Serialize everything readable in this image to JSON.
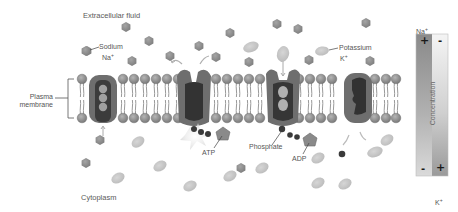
{
  "regions": {
    "extracellular": "Extracellular fluid",
    "cytoplasm": "Cytoplasm"
  },
  "membrane": {
    "label_line1": "Plasma",
    "label_line2": "membrane"
  },
  "ions": {
    "sodium": {
      "name": "Sodium",
      "symbol": "Na",
      "charge": "+"
    },
    "potassium": {
      "name": "Potassium",
      "symbol": "K",
      "charge": "+"
    }
  },
  "molecules": {
    "atp": "ATP",
    "adp": "ADP",
    "phosphate": "Phosphate"
  },
  "gradient": {
    "top_label_symbol": "Na",
    "top_label_charge": "+",
    "bottom_label_symbol": "K",
    "bottom_label_charge": "+",
    "axis_label": "Concentration",
    "na_top_sign": "+",
    "k_top_sign": "-",
    "na_bottom_sign": "-",
    "k_bottom_sign": "+"
  },
  "colors": {
    "sodium_fill": "#8a8a8a",
    "potassium_fill": "#c2c2c2",
    "protein_outer": "#6e6e6e",
    "protein_core": "#3a3a3a",
    "head_fill": "#8c8c8c",
    "phosphate_fill": "#3d3d3d",
    "text": "#555555"
  }
}
